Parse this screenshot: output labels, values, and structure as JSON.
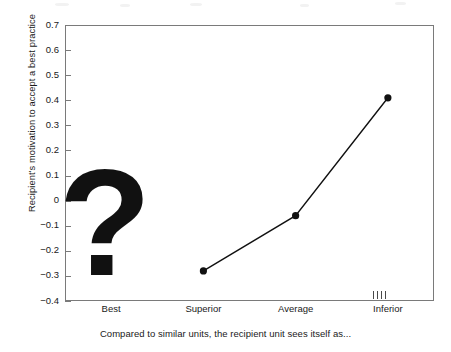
{
  "chart_data": {
    "type": "line",
    "title": "",
    "subtitle": "",
    "xlabel": "Compared to similar units, the recipient unit sees itself as...",
    "ylabel": "Recipient's motivation to accept a best practice",
    "categories": [
      "Best",
      "Superior",
      "Average",
      "Inferior"
    ],
    "values": [
      null,
      -0.28,
      -0.06,
      0.41
    ],
    "series": [
      {
        "name": "Recipient's motivation to accept a best practice",
        "values": [
          null,
          -0.28,
          -0.06,
          0.41
        ]
      }
    ],
    "ylim": [
      -0.4,
      0.7
    ],
    "ytick_labels": [
      "0.7",
      "0.6",
      "0.5",
      "0.4",
      "0.3",
      "0.2",
      "0.1",
      "0",
      "-0.1",
      "-0.2",
      "-0.3",
      "-0.4"
    ],
    "ytick_values": [
      0.7,
      0.6,
      0.5,
      0.4,
      0.3,
      0.2,
      0.1,
      0.0,
      -0.1,
      -0.2,
      -0.3,
      -0.4
    ],
    "grid": false,
    "legend": "none",
    "line_color": "#111111",
    "marker_color": "#111111",
    "frame_color": "#7a7a7a",
    "background_color": "#ffffff",
    "annotations": [
      {
        "name": "missing-value-question-mark",
        "text": "?",
        "category": "Best",
        "meaning": "value unknown / not measured for the Best category"
      }
    ],
    "annotation_ticks": {
      "name": "inferior-axis-tick-marks",
      "count": 4,
      "near_category": "Inferior"
    }
  }
}
